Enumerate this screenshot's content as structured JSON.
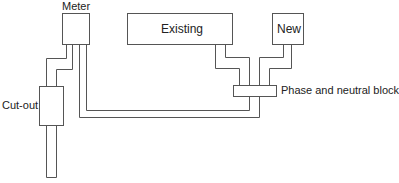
{
  "diagram": {
    "components": {
      "meter": {
        "label": "Meter"
      },
      "cutout": {
        "label": "Cut-out"
      },
      "existing": {
        "label": "Existing"
      },
      "new": {
        "label": "New"
      },
      "block": {
        "label": "Phase and neutral block"
      }
    },
    "colors": {
      "line": "#555555",
      "text": "#222222",
      "background": "#ffffff"
    }
  }
}
